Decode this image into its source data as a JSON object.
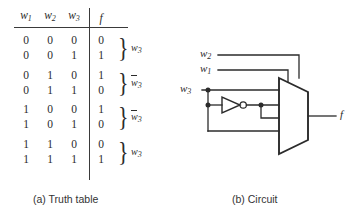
{
  "figure": {
    "caption_a": "(a) Truth table",
    "caption_b": "(b) Circuit"
  },
  "truth_table": {
    "headers": [
      "w",
      "w",
      "w",
      "f"
    ],
    "header_subs": [
      "1",
      "2",
      "3",
      ""
    ],
    "rows": [
      {
        "inputs": [
          "0",
          "0",
          "0"
        ],
        "f": "0"
      },
      {
        "inputs": [
          "0",
          "0",
          "1"
        ],
        "f": "1"
      },
      {
        "inputs": [
          "0",
          "1",
          "0"
        ],
        "f": "1"
      },
      {
        "inputs": [
          "0",
          "1",
          "1"
        ],
        "f": "0"
      },
      {
        "inputs": [
          "1",
          "0",
          "0"
        ],
        "f": "1"
      },
      {
        "inputs": [
          "1",
          "0",
          "1"
        ],
        "f": "0"
      },
      {
        "inputs": [
          "1",
          "1",
          "0"
        ],
        "f": "0"
      },
      {
        "inputs": [
          "1",
          "1",
          "1"
        ],
        "f": "1"
      }
    ],
    "group_annotations": [
      {
        "base": "w",
        "sub": "3",
        "overbar": false
      },
      {
        "base": "w",
        "sub": "3",
        "overbar": true
      },
      {
        "base": "w",
        "sub": "3",
        "overbar": true
      },
      {
        "base": "w",
        "sub": "3",
        "overbar": false
      }
    ],
    "brace_glyph": "}"
  },
  "circuit": {
    "select_labels": [
      {
        "base": "w",
        "sub": "2"
      },
      {
        "base": "w",
        "sub": "1"
      }
    ],
    "data_label": {
      "base": "w",
      "sub": "3"
    },
    "output_label": "f",
    "mux_inputs": [
      {
        "base": "w",
        "sub": "3",
        "overbar": false
      },
      {
        "base": "w",
        "sub": "3",
        "overbar": true
      },
      {
        "base": "w",
        "sub": "3",
        "overbar": true
      },
      {
        "base": "w",
        "sub": "3",
        "overbar": false
      }
    ],
    "gate": "inverter",
    "mux_type": "4-to-1 multiplexer",
    "colors": {
      "line": "#2b2b2b",
      "text": "#2b2b2b",
      "background": "#ffffff"
    }
  }
}
